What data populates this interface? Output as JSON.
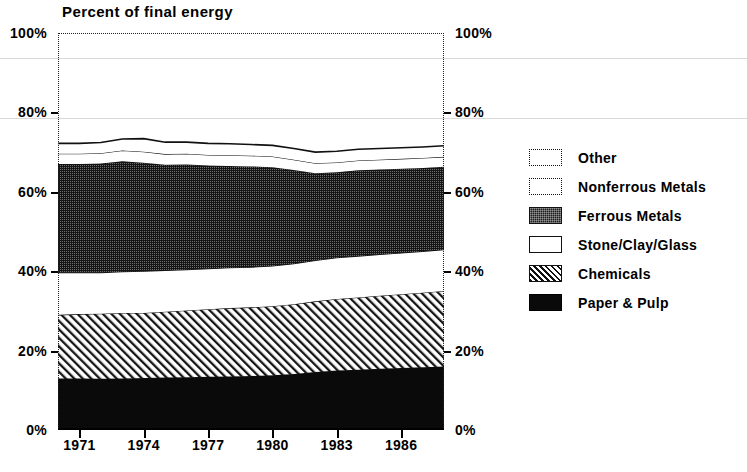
{
  "chart_data": {
    "type": "area",
    "title": "Percent of final energy",
    "xlabel": "",
    "ylabel": "",
    "stacked": true,
    "grid": false,
    "legend_position": "right",
    "xlim": [
      1970,
      1988
    ],
    "ylim": [
      0,
      100
    ],
    "x_tick_labels": [
      "1971",
      "1974",
      "1977",
      "1980",
      "1983",
      "1986"
    ],
    "x_tick_values": [
      1971,
      1974,
      1977,
      1980,
      1983,
      1986
    ],
    "y_tick_labels": [
      "0%",
      "20%",
      "40%",
      "60%",
      "80%",
      "100%"
    ],
    "y_tick_values": [
      0,
      20,
      40,
      60,
      80,
      100
    ],
    "y_axis_right_labels": [
      "0%",
      "20%",
      "40%",
      "60%",
      "80%",
      "100%"
    ],
    "x": [
      1970,
      1971,
      1972,
      1973,
      1974,
      1975,
      1976,
      1977,
      1978,
      1979,
      1980,
      1981,
      1982,
      1983,
      1984,
      1985,
      1986,
      1987,
      1988
    ],
    "series": [
      {
        "name": "Paper & Pulp",
        "fill": "solid-black",
        "color": "#0a0a0a",
        "values": [
          13.0,
          13.0,
          12.9,
          13.0,
          13.1,
          13.2,
          13.3,
          13.4,
          13.5,
          13.6,
          13.8,
          14.1,
          14.6,
          15.0,
          15.2,
          15.4,
          15.6,
          15.8,
          16.0
        ]
      },
      {
        "name": "Chemicals",
        "fill": "diagonal-hatch",
        "color": "#8a8a8a",
        "values": [
          16.0,
          16.2,
          16.4,
          16.5,
          16.4,
          16.6,
          16.8,
          17.0,
          17.2,
          17.3,
          17.4,
          17.6,
          17.8,
          18.0,
          18.2,
          18.4,
          18.6,
          18.8,
          19.0
        ]
      },
      {
        "name": "Stone/Clay/Glass",
        "fill": "white-outline",
        "color": "#ffffff",
        "values": [
          10.6,
          10.4,
          10.3,
          10.4,
          10.5,
          10.4,
          10.3,
          10.2,
          10.2,
          10.1,
          10.1,
          10.2,
          10.3,
          10.4,
          10.4,
          10.4,
          10.4,
          10.4,
          10.4
        ]
      },
      {
        "name": "Ferrous Metals",
        "fill": "dark-dotted",
        "color": "#1b1b1b",
        "values": [
          27.4,
          27.4,
          27.5,
          27.8,
          27.3,
          26.6,
          26.5,
          26.0,
          25.6,
          25.4,
          24.9,
          23.6,
          22.0,
          21.5,
          21.6,
          21.4,
          21.2,
          21.0,
          20.9
        ]
      },
      {
        "name": "Nonferrous Metals",
        "fill": "white-dotted-outline",
        "color": "#ffffff",
        "values": [
          2.6,
          2.6,
          2.6,
          2.7,
          2.8,
          2.7,
          2.7,
          2.7,
          2.7,
          2.7,
          2.7,
          2.6,
          2.5,
          2.5,
          2.5,
          2.5,
          2.5,
          2.5,
          2.5
        ]
      },
      {
        "name": "Other",
        "fill": "white-dotted-outline",
        "color": "#ffffff",
        "values": [
          2.6,
          2.6,
          2.7,
          2.9,
          3.3,
          3.0,
          2.9,
          2.9,
          2.9,
          2.8,
          2.8,
          2.8,
          2.8,
          2.8,
          2.8,
          2.8,
          2.8,
          2.8,
          2.8
        ]
      }
    ],
    "totals": [
      72.2,
      72.2,
      72.4,
      73.3,
      73.4,
      72.5,
      72.5,
      72.2,
      72.1,
      71.9,
      71.7,
      70.9,
      70.0,
      70.2,
      70.7,
      70.9,
      71.1,
      71.3,
      71.6
    ]
  },
  "legend": {
    "items": [
      {
        "label": "Other",
        "swatch": "white-dotted-outline"
      },
      {
        "label": "Nonferrous Metals",
        "swatch": "white-dotted-outline"
      },
      {
        "label": "Ferrous Metals",
        "swatch": "dark-dotted"
      },
      {
        "label": "Stone/Clay/Glass",
        "swatch": "white-outline"
      },
      {
        "label": "Chemicals",
        "swatch": "diagonal-hatch"
      },
      {
        "label": "Paper & Pulp",
        "swatch": "solid-black"
      }
    ]
  }
}
